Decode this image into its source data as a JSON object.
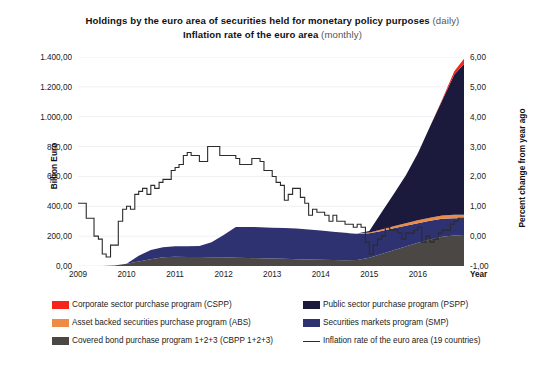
{
  "titles": {
    "line1_bold": "Holdings by the euro area of securities held for monetary policy purposes",
    "line1_soft": "(daily)",
    "line2_bold": "Inflation rate of the euro area",
    "line2_soft": "(monthly)"
  },
  "axes": {
    "y_left_title": "Billion Euro",
    "y_right_title": "Percent change from year ago",
    "x_title": "Year",
    "y_left_ticks": [
      "0,00",
      "200,00",
      "400,00",
      "600,00",
      "800,00",
      "1.000,00",
      "1.200,00",
      "1.400,00"
    ],
    "y_right_ticks": [
      "-1,00",
      "0,00",
      "1,00",
      "2,00",
      "3,00",
      "4,00",
      "5,00",
      "6,00"
    ],
    "x_ticks": [
      "2009",
      "2010",
      "2011",
      "2012",
      "2013",
      "2014",
      "2015",
      "2016"
    ]
  },
  "legend": {
    "left_column": [
      {
        "label": "Corporate sector purchase program (CSPP)",
        "color": "#f4251b",
        "type": "area",
        "name": "legend-item-cspp"
      },
      {
        "label": "Asset backed securities purchase program (ABS)",
        "color": "#ed8a46",
        "type": "area",
        "name": "legend-item-abs"
      },
      {
        "label": "Covered bond purchase program 1+2+3 (CBPP 1+2+3)",
        "color": "#4a4745",
        "type": "area",
        "name": "legend-item-cbpp"
      }
    ],
    "right_column": [
      {
        "label": "Public sector purchase program (PSPP)",
        "color": "#1c1a3c",
        "type": "area",
        "name": "legend-item-pspp"
      },
      {
        "label": "Securities markets program (SMP)",
        "color": "#2f3271",
        "type": "area",
        "name": "legend-item-smp"
      },
      {
        "label": "Inflation rate of the euro area (19 countries)",
        "color": "#2b2b2b",
        "type": "line",
        "name": "legend-item-inflation"
      }
    ]
  },
  "chart_data": {
    "type": "area",
    "xlabel": "Year",
    "ylabel": "Billion Euro",
    "y2label": "Percent change from year ago",
    "xlim": [
      2009.0,
      2016.95
    ],
    "ylim": [
      0,
      1400
    ],
    "y2lim": [
      -1,
      6
    ],
    "grid": "faint-horizontal",
    "legend_position": "below",
    "stacked": true,
    "stack_order_bottom_to_top": [
      "CBPP 1+2+3",
      "SMP",
      "ABS",
      "PSPP",
      "CSPP"
    ],
    "x": [
      2009.0,
      2009.25,
      2009.5,
      2009.75,
      2010.0,
      2010.25,
      2010.5,
      2010.75,
      2011.0,
      2011.25,
      2011.5,
      2011.75,
      2012.0,
      2012.25,
      2012.5,
      2012.75,
      2013.0,
      2013.25,
      2013.5,
      2013.75,
      2014.0,
      2014.25,
      2014.5,
      2014.75,
      2015.0,
      2015.25,
      2015.5,
      2015.75,
      2016.0,
      2016.25,
      2016.5,
      2016.75,
      2016.95
    ],
    "series": [
      {
        "name": "Covered bond purchase program 1+2+3 (CBPP 1+2+3)",
        "color": "#4a4745",
        "axis": "left",
        "values": [
          0,
          0,
          0,
          4,
          15,
          30,
          45,
          58,
          62,
          61,
          60,
          59,
          58,
          56,
          54,
          52,
          50,
          48,
          46,
          44,
          42,
          40,
          38,
          40,
          55,
          80,
          105,
          130,
          155,
          178,
          196,
          205,
          208
        ]
      },
      {
        "name": "Securities markets program (SMP)",
        "color": "#2f3271",
        "axis": "left",
        "values": [
          0,
          0,
          0,
          0,
          0,
          38,
          62,
          68,
          70,
          72,
          74,
          100,
          150,
          205,
          208,
          208,
          207,
          206,
          205,
          200,
          195,
          190,
          185,
          175,
          165,
          155,
          148,
          140,
          132,
          125,
          120,
          115,
          112
        ]
      },
      {
        "name": "Asset backed securities purchase program (ABS)",
        "color": "#ed8a46",
        "axis": "left",
        "values": [
          0,
          0,
          0,
          0,
          0,
          0,
          0,
          0,
          0,
          0,
          0,
          0,
          0,
          0,
          0,
          0,
          0,
          0,
          0,
          0,
          0,
          0,
          0,
          2,
          5,
          9,
          13,
          16,
          19,
          21,
          22,
          23,
          23
        ]
      },
      {
        "name": "Public sector purchase program (PSPP)",
        "color": "#1c1a3c",
        "axis": "left",
        "values": [
          0,
          0,
          0,
          0,
          0,
          0,
          0,
          0,
          0,
          0,
          0,
          0,
          0,
          0,
          0,
          0,
          0,
          0,
          0,
          0,
          0,
          0,
          0,
          0,
          10,
          115,
          215,
          320,
          450,
          610,
          770,
          940,
          1010
        ]
      },
      {
        "name": "Corporate sector purchase program (CSPP)",
        "color": "#f4251b",
        "axis": "left",
        "values": [
          0,
          0,
          0,
          0,
          0,
          0,
          0,
          0,
          0,
          0,
          0,
          0,
          0,
          0,
          0,
          0,
          0,
          0,
          0,
          0,
          0,
          0,
          0,
          0,
          0,
          0,
          0,
          0,
          0,
          0,
          8,
          22,
          35
        ]
      }
    ],
    "line_series": {
      "name": "Inflation rate of the euro area (19 countries)",
      "color": "#2b2b2b",
      "axis": "right",
      "style": "step",
      "x": [
        2009.0,
        2009.08,
        2009.17,
        2009.25,
        2009.33,
        2009.42,
        2009.5,
        2009.58,
        2009.67,
        2009.75,
        2009.83,
        2009.92,
        2010.0,
        2010.08,
        2010.17,
        2010.25,
        2010.33,
        2010.42,
        2010.5,
        2010.58,
        2010.67,
        2010.75,
        2010.83,
        2010.92,
        2011.0,
        2011.08,
        2011.17,
        2011.25,
        2011.33,
        2011.42,
        2011.5,
        2011.58,
        2011.67,
        2011.75,
        2011.83,
        2011.92,
        2012.0,
        2012.08,
        2012.17,
        2012.25,
        2012.33,
        2012.42,
        2012.5,
        2012.58,
        2012.67,
        2012.75,
        2012.83,
        2012.92,
        2013.0,
        2013.08,
        2013.17,
        2013.25,
        2013.33,
        2013.42,
        2013.5,
        2013.58,
        2013.67,
        2013.75,
        2013.83,
        2013.92,
        2014.0,
        2014.08,
        2014.17,
        2014.25,
        2014.33,
        2014.42,
        2014.5,
        2014.58,
        2014.67,
        2014.75,
        2014.83,
        2014.92,
        2015.0,
        2015.08,
        2015.17,
        2015.25,
        2015.33,
        2015.42,
        2015.5,
        2015.58,
        2015.67,
        2015.75,
        2015.83,
        2015.92,
        2016.0,
        2016.08,
        2016.17,
        2016.25,
        2016.33,
        2016.42,
        2016.5,
        2016.58,
        2016.67,
        2016.75,
        2016.83,
        2016.92
      ],
      "values": [
        1.1,
        1.1,
        0.6,
        0.6,
        0.0,
        -0.1,
        -0.6,
        -0.7,
        -0.3,
        -0.3,
        0.5,
        0.9,
        1.0,
        0.9,
        1.4,
        1.5,
        1.6,
        1.4,
        1.7,
        1.6,
        1.8,
        1.9,
        1.9,
        2.2,
        2.3,
        2.4,
        2.7,
        2.8,
        2.7,
        2.7,
        2.5,
        2.5,
        3.0,
        3.0,
        3.0,
        2.7,
        2.7,
        2.7,
        2.7,
        2.6,
        2.4,
        2.4,
        2.4,
        2.6,
        2.6,
        2.5,
        2.2,
        2.2,
        2.0,
        1.8,
        1.7,
        1.2,
        1.4,
        1.6,
        1.6,
        1.3,
        1.1,
        0.7,
        0.9,
        0.8,
        0.8,
        0.7,
        0.5,
        0.7,
        0.5,
        0.5,
        0.4,
        0.4,
        0.3,
        0.4,
        0.3,
        -0.2,
        -0.6,
        -0.3,
        -0.1,
        0.0,
        0.3,
        0.2,
        0.2,
        0.1,
        -0.1,
        0.1,
        0.1,
        0.2,
        0.3,
        -0.2,
        0.0,
        -0.2,
        -0.1,
        0.1,
        0.2,
        0.2,
        0.4,
        0.5,
        0.6,
        0.6
      ]
    }
  }
}
